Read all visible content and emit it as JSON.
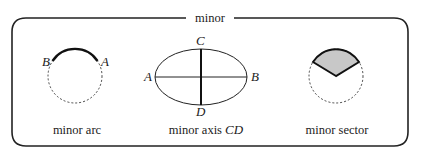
{
  "title": "minor",
  "colors": {
    "stroke": "#222222",
    "sector_fill": "#c8c8c8",
    "background": "#ffffff"
  },
  "panels": [
    {
      "id": "arc",
      "caption": "minor arc",
      "points": {
        "B": "B",
        "A": "A"
      }
    },
    {
      "id": "axis",
      "caption_text": "minor axis ",
      "caption_math": "CD",
      "points": {
        "A": "A",
        "B": "B",
        "C": "C",
        "D": "D"
      }
    },
    {
      "id": "sector",
      "caption": "minor sector"
    }
  ]
}
